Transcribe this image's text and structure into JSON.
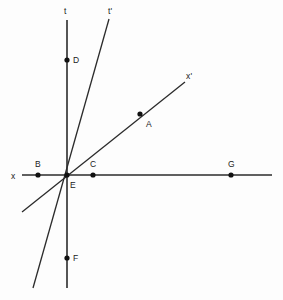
{
  "figure": {
    "width": 283,
    "height": 300,
    "background_color": "#fdfdfd",
    "line_color": "#2b2b2b",
    "point_color": "#111111",
    "label_color": "#1a1a1a"
  },
  "axes": {
    "t": {
      "label": "t",
      "label_x": 64,
      "label_y": 7,
      "x1": 67,
      "y1": 20,
      "x2": 67,
      "y2": 288
    },
    "x": {
      "label": "x",
      "label_x": 11,
      "label_y": 172,
      "x1": 22,
      "y1": 175,
      "x2": 272,
      "y2": 175
    },
    "t_prime": {
      "label": "t'",
      "label_x": 108,
      "label_y": 7,
      "x1": 109,
      "y1": 19,
      "x2": 33,
      "y2": 288
    },
    "x_prime": {
      "label": "x'",
      "label_x": 186,
      "label_y": 72,
      "x1": 185,
      "y1": 82,
      "x2": 22,
      "y2": 212
    }
  },
  "points": [
    {
      "name": "D",
      "cx": 67,
      "cy": 60,
      "label": "D",
      "label_x": 73,
      "label_y": 56
    },
    {
      "name": "A",
      "cx": 140,
      "cy": 114,
      "label": "A",
      "label_x": 146,
      "label_y": 120
    },
    {
      "name": "B",
      "cx": 38,
      "cy": 175,
      "label": "B",
      "label_x": 35,
      "label_y": 160
    },
    {
      "name": "C",
      "cx": 93,
      "cy": 175,
      "label": "C",
      "label_x": 90,
      "label_y": 160
    },
    {
      "name": "G",
      "cx": 231,
      "cy": 175,
      "label": "G",
      "label_x": 228,
      "label_y": 160
    },
    {
      "name": "E",
      "cx": 67,
      "cy": 175,
      "label": "E",
      "label_x": 70,
      "label_y": 181
    },
    {
      "name": "F",
      "cx": 67,
      "cy": 258,
      "label": "F",
      "label_x": 73,
      "label_y": 254
    }
  ],
  "point_radius": 2.6
}
